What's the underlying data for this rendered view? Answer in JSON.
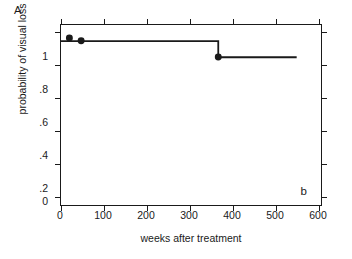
{
  "figure": {
    "panel_letter": "A",
    "inner_annotation": "b"
  },
  "chart_data": {
    "type": "line",
    "title": "",
    "subtitle": "",
    "xlabel": "weeks after treatment",
    "ylabel": "probability of visual loss",
    "xlim": [
      0,
      620
    ],
    "ylim": [
      0,
      1.06
    ],
    "xticks": [
      0,
      100,
      200,
      300,
      400,
      500,
      600
    ],
    "xticklabels": [
      "0",
      "100",
      "200",
      "300",
      "400",
      "500",
      "600"
    ],
    "yticks": [
      0,
      0.2,
      0.4,
      0.6,
      0.8,
      1
    ],
    "yticklabels": [
      "0",
      ".2",
      ".4",
      ".6",
      ".8",
      "1"
    ],
    "grid": false,
    "legend": null,
    "series": [
      {
        "name": "Kaplan-Meier survival curve",
        "style": "step-post",
        "color": "#1a1a1a",
        "linewidth": 1.8,
        "x": [
          0,
          375,
          375,
          562
        ],
        "y": [
          0.965,
          0.965,
          0.87,
          0.87
        ]
      }
    ],
    "censor_markers": {
      "name": "censored observations",
      "marker": "filled-circle",
      "color": "#1a1a1a",
      "size": 7,
      "points": [
        {
          "x": 20,
          "y": 0.983
        },
        {
          "x": 48,
          "y": 0.967
        },
        {
          "x": 375,
          "y": 0.872
        }
      ]
    },
    "annotations": [
      {
        "text": "b",
        "x": 560,
        "y": 0.05,
        "position": "inside-bottom-right"
      },
      {
        "text": "A",
        "position": "outside-top-left"
      }
    ]
  },
  "colors": {
    "line": "#1a1a1a",
    "axis": "#1a1a1a",
    "background": "#ffffff"
  }
}
